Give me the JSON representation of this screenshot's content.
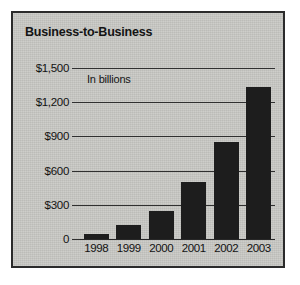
{
  "chart_data": {
    "type": "bar",
    "title": "Business-to-Business",
    "annotation": "In billions",
    "categories": [
      "1998",
      "1999",
      "2000",
      "2001",
      "2002",
      "2003"
    ],
    "values": [
      45,
      120,
      250,
      500,
      850,
      1330
    ],
    "xlabel": "",
    "ylabel": "",
    "ylim": [
      0,
      1500
    ],
    "yticks": [
      0,
      300,
      600,
      900,
      1200,
      1500
    ],
    "ytick_labels": [
      "0",
      "$300",
      "$600",
      "$900",
      "$1,200",
      "$1,500"
    ],
    "grid": true,
    "legend": false,
    "series": [
      {
        "name": "Business-to-Business",
        "values": [
          45,
          120,
          250,
          500,
          850,
          1330
        ]
      }
    ],
    "colors": {
      "bar": "#1d1d1d",
      "panel_background": "#c9c9c5",
      "panel_border": "#2b2b2b",
      "gridline": "#303030",
      "text": "#121212",
      "page_background": "#ffffff"
    }
  }
}
